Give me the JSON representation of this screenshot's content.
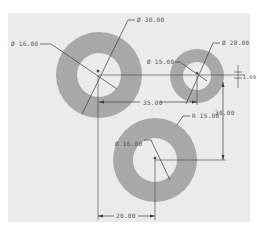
{
  "drawing": {
    "background": "#ebebeb",
    "ring_color": "#a8a8a8",
    "hole_color": "#ebebeb",
    "line_color": "#3c3c3c",
    "text_color": "#555555",
    "rings": [
      {
        "name": "ring-top-left",
        "cx": 99,
        "cy": 75,
        "r_outer": 43,
        "r_inner": 22
      },
      {
        "name": "ring-top-right",
        "cx": 197,
        "cy": 76,
        "r_outer": 27,
        "r_inner": 14
      },
      {
        "name": "ring-bottom",
        "cx": 155,
        "cy": 160,
        "r_outer": 42,
        "r_inner": 22
      }
    ],
    "labels": {
      "d30": "Ø 30.00",
      "d16_top": "Ø 16.00",
      "d28": "Ø 28.00",
      "d15": "Ø 15.00",
      "d16_bottom": "Ø 16.00",
      "r15": "R 15.00",
      "dim35": "35.00",
      "dim30": "30.00",
      "dim20": "20.00",
      "dim_small": "1.00"
    }
  }
}
